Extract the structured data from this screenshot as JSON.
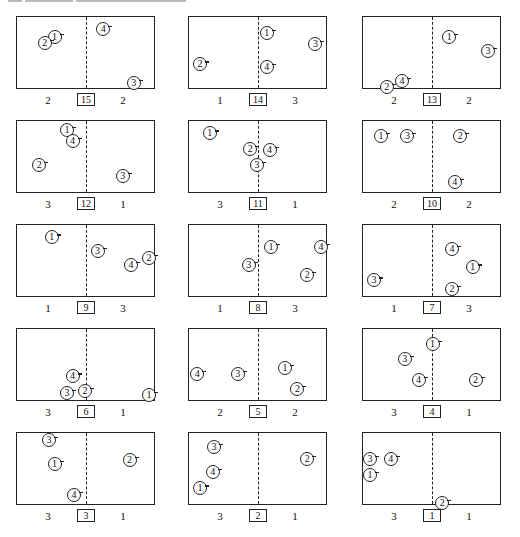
{
  "header": {
    "visible_text": "",
    "note_truncated": true
  },
  "legend": {
    "players": [
      "1",
      "2",
      "3",
      "4"
    ]
  },
  "panels": [
    {
      "number": "15",
      "left_score": "2",
      "right_score": "2",
      "players": [
        "1",
        "2",
        "3",
        "4"
      ]
    },
    {
      "number": "14",
      "left_score": "1",
      "right_score": "3",
      "players": [
        "1",
        "2",
        "3",
        "4"
      ]
    },
    {
      "number": "13",
      "left_score": "2",
      "right_score": "2",
      "players": [
        "1",
        "2",
        "3",
        "4"
      ]
    },
    {
      "number": "12",
      "left_score": "3",
      "right_score": "1",
      "players": [
        "1",
        "2",
        "3",
        "4"
      ]
    },
    {
      "number": "11",
      "left_score": "3",
      "right_score": "1",
      "players": [
        "1",
        "2",
        "3",
        "4"
      ]
    },
    {
      "number": "10",
      "left_score": "2",
      "right_score": "2",
      "players": [
        "1",
        "2",
        "3",
        "4"
      ]
    },
    {
      "number": "9",
      "left_score": "1",
      "right_score": "3",
      "players": [
        "1",
        "2",
        "3",
        "4"
      ]
    },
    {
      "number": "8",
      "left_score": "1",
      "right_score": "3",
      "players": [
        "1",
        "2",
        "3",
        "4"
      ]
    },
    {
      "number": "7",
      "left_score": "1",
      "right_score": "3",
      "players": [
        "1",
        "2",
        "3",
        "4"
      ]
    },
    {
      "number": "6",
      "left_score": "3",
      "right_score": "1",
      "players": [
        "1",
        "2",
        "3",
        "4"
      ]
    },
    {
      "number": "5",
      "left_score": "2",
      "right_score": "2",
      "players": [
        "1",
        "2",
        "3",
        "4"
      ]
    },
    {
      "number": "4",
      "left_score": "3",
      "right_score": "1",
      "players": [
        "1",
        "2",
        "3",
        "4"
      ]
    },
    {
      "number": "3",
      "left_score": "3",
      "right_score": "1",
      "players": [
        "1",
        "2",
        "3",
        "4"
      ]
    },
    {
      "number": "2",
      "left_score": "3",
      "right_score": "1",
      "players": [
        "1",
        "2",
        "3",
        "4"
      ]
    },
    {
      "number": "1",
      "left_score": "3",
      "right_score": "1",
      "players": [
        "1",
        "2",
        "3",
        "4"
      ]
    }
  ]
}
